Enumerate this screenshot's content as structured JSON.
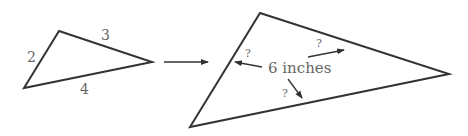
{
  "diagram": {
    "small_triangle": {
      "vertices": [
        [
          59,
          31
        ],
        [
          152,
          62
        ],
        [
          24,
          88
        ]
      ],
      "side_labels": {
        "left": "2",
        "top": "3",
        "bottom": "4"
      }
    },
    "transform_arrow": {
      "from": [
        164,
        62
      ],
      "to": [
        208,
        62
      ]
    },
    "large_triangle": {
      "vertices": [
        [
          260,
          13
        ],
        [
          449,
          74
        ],
        [
          190,
          127
        ]
      ],
      "center_label": "6 inches",
      "unknown_labels": {
        "left": "?",
        "top": "?",
        "bottom": "?"
      }
    },
    "colors": {
      "stroke": "#333333",
      "label": "#666666"
    }
  }
}
